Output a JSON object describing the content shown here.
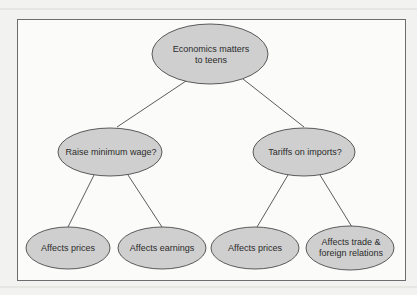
{
  "diagram": {
    "type": "tree",
    "colors": {
      "node_fill": "#cfcfcf",
      "node_stroke": "#4a4a4a",
      "edge": "#4a4a4a",
      "frame": "#6d6d6d",
      "background": "#fbfbfa"
    },
    "root": {
      "id": "root",
      "label_line1": "Economics matters",
      "label_line2": "to teens"
    },
    "branches": [
      {
        "id": "min-wage",
        "label": "Raise minimum wage?",
        "children": [
          {
            "id": "mw-prices",
            "label": "Affects prices"
          },
          {
            "id": "mw-earnings",
            "label": "Affects earnings"
          }
        ]
      },
      {
        "id": "tariffs",
        "label": "Tariffs on imports?",
        "children": [
          {
            "id": "tr-prices",
            "label": "Affects prices"
          },
          {
            "id": "tr-trade",
            "label_line1": "Affects trade &",
            "label_line2": "foreign relations"
          }
        ]
      }
    ]
  }
}
